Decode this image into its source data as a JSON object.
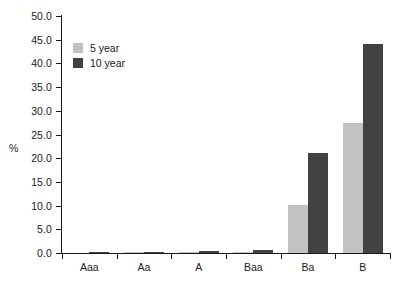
{
  "chart_data": {
    "type": "bar",
    "title": "",
    "subtitle": "",
    "xlabel": "",
    "ylabel": "%",
    "categories": [
      "Aaa",
      "Aa",
      "A",
      "Baa",
      "Ba",
      "B"
    ],
    "series": [
      {
        "name": "5 year",
        "color": "#c2c2c2",
        "values": [
          0.0,
          0.3,
          0.3,
          0.3,
          10.2,
          27.5
        ]
      },
      {
        "name": "10 year",
        "color": "#424242",
        "values": [
          0.3,
          0.3,
          0.5,
          0.6,
          21.0,
          44.0
        ]
      }
    ],
    "ylim": [
      0.0,
      50.0
    ],
    "ytick_step": 5.0,
    "ytick_labels": [
      "0.0",
      "5.0",
      "10.0",
      "15.0",
      "20.0",
      "25.0",
      "30.0",
      "35.0",
      "40.0",
      "45.0",
      "50.0"
    ],
    "ytick_values": [
      0.0,
      5.0,
      10.0,
      15.0,
      20.0,
      25.0,
      30.0,
      35.0,
      40.0,
      45.0,
      50.0
    ],
    "grid": false,
    "legend_position": "upper-left-inside",
    "axis_color": "#1a1a1a",
    "background": "#ffffff"
  },
  "legend": {
    "entries": [
      {
        "label": "5 year",
        "swatch": "legend-swatch-5-year"
      },
      {
        "label": "10 year",
        "swatch": "legend-swatch-10-year"
      }
    ]
  }
}
